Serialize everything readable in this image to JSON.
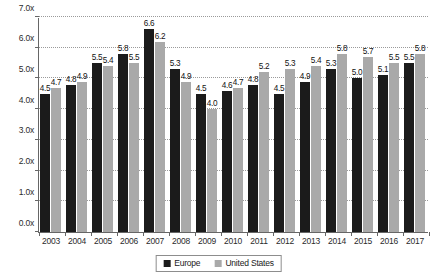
{
  "chart_data": {
    "type": "bar",
    "title": "",
    "subtitle": "",
    "xlabel": "",
    "ylabel": "",
    "ylim": [
      0,
      7
    ],
    "ytick_step": 1,
    "ytick_labels": [
      "0.0x",
      "1.0x",
      "2.0x",
      "3.0x",
      "4.0x",
      "5.0x",
      "6.0x",
      "7.0x"
    ],
    "ytick_values": [
      0,
      1,
      2,
      3,
      4,
      5,
      6,
      7
    ],
    "grid": true,
    "grid_style": "dotted-horizontal",
    "legend_position": "bottom-center",
    "categories": [
      "2003",
      "2004",
      "2005",
      "2006",
      "2007",
      "2008",
      "2009",
      "2010",
      "2011",
      "2012",
      "2013",
      "2014",
      "2015",
      "2016",
      "2017"
    ],
    "series": [
      {
        "name": "Europe",
        "color": "#1b1b1b",
        "values": [
          4.5,
          4.8,
          5.5,
          5.8,
          6.6,
          5.3,
          4.5,
          4.6,
          4.8,
          4.5,
          4.9,
          5.3,
          5.0,
          5.1,
          5.5
        ],
        "labels": [
          "4.5",
          "4.8",
          "5.5",
          "5.8",
          "6.6",
          "5.3",
          "4.5",
          "4.6",
          "4.8",
          "4.5",
          "4.9",
          "5.3",
          "5.0",
          "5.1",
          "5.5"
        ]
      },
      {
        "name": "United States",
        "color": "#a9a9a9",
        "values": [
          4.7,
          4.9,
          5.4,
          5.5,
          6.2,
          4.9,
          4.0,
          4.7,
          5.2,
          5.3,
          5.4,
          5.8,
          5.7,
          5.5,
          5.8
        ],
        "labels": [
          "4.7",
          "4.9",
          "5.4",
          "5.5",
          "6.2",
          "4.9",
          "4.0",
          "4.7",
          "5.2",
          "5.3",
          "5.4",
          "5.8",
          "5.7",
          "5.5",
          "5.8"
        ]
      }
    ]
  },
  "legend": {
    "items": [
      {
        "label": "Europe",
        "color": "#1b1b1b"
      },
      {
        "label": "United States",
        "color": "#a9a9a9"
      }
    ]
  },
  "colors": {
    "europe": "#1b1b1b",
    "united_states": "#a9a9a9",
    "axis": "#666666",
    "grid": "#9a9a9a",
    "background": "#ffffff"
  }
}
